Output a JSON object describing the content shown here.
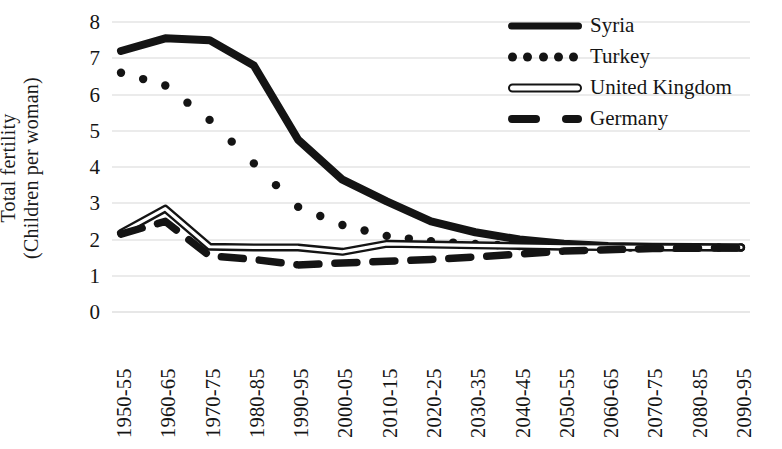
{
  "chart_data": {
    "type": "line",
    "title": "",
    "xlabel": "",
    "ylabel": "Total fertility (Children per woman)",
    "ylabel_lines": [
      "Total fertility",
      "(Children per woman)"
    ],
    "ylim": [
      0,
      8
    ],
    "ytick_step": 1,
    "yticks": [
      "8",
      "7",
      "6",
      "5",
      "4",
      "3",
      "2",
      "1",
      "0"
    ],
    "grid": true,
    "grid_axis": "y",
    "legend_position": "top-right",
    "categories": [
      "1950-55",
      "1960-65",
      "1970-75",
      "1980-85",
      "1990-95",
      "2000-05",
      "2010-15",
      "2020-25",
      "2030-35",
      "2040-45",
      "2050-55",
      "2060-65",
      "2070-75",
      "2080-85",
      "2090-95"
    ],
    "series": [
      {
        "name": "Syria",
        "style": "solid-thick",
        "color": "#141414",
        "values": [
          7.2,
          7.55,
          7.5,
          6.8,
          4.75,
          3.65,
          3.05,
          2.5,
          2.2,
          2.0,
          1.88,
          1.82,
          1.8,
          1.79,
          1.78
        ]
      },
      {
        "name": "Turkey",
        "style": "dotted",
        "color": "#141414",
        "values": [
          6.6,
          6.25,
          5.3,
          4.1,
          2.9,
          2.4,
          2.1,
          1.95,
          1.88,
          1.82,
          1.79,
          1.78,
          1.78,
          1.78,
          1.78
        ]
      },
      {
        "name": "United Kingdom",
        "style": "hollow-line",
        "color": "#141414",
        "values": [
          2.18,
          2.85,
          1.8,
          1.78,
          1.78,
          1.66,
          1.88,
          1.86,
          1.84,
          1.82,
          1.8,
          1.79,
          1.78,
          1.78,
          1.78
        ]
      },
      {
        "name": "Germany",
        "style": "dashed",
        "color": "#141414",
        "values": [
          2.15,
          2.5,
          1.55,
          1.45,
          1.3,
          1.35,
          1.4,
          1.45,
          1.52,
          1.6,
          1.68,
          1.72,
          1.75,
          1.76,
          1.77
        ]
      }
    ]
  },
  "legend": {
    "items": [
      {
        "label": "Syria",
        "key": "solid-line-key"
      },
      {
        "label": "Turkey",
        "key": "dotted-line-key"
      },
      {
        "label": "United Kingdom",
        "key": "hollow-line-key"
      },
      {
        "label": "Germany",
        "key": "dashed-line-key"
      }
    ]
  }
}
